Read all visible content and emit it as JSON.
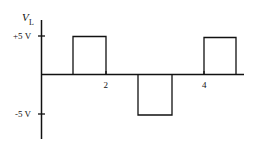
{
  "diagram": {
    "type": "waveform",
    "y_axis": {
      "label_main": "V",
      "label_sub": "L",
      "ticks": [
        {
          "label": "+5 V",
          "value": 5
        },
        {
          "label": "-5 V",
          "value": -5
        }
      ]
    },
    "x_axis": {
      "ticks": [
        {
          "label": "2",
          "value": 2
        },
        {
          "label": "4",
          "value": 4
        }
      ]
    },
    "pulses": [
      {
        "start": 1,
        "end": 2,
        "level": 5
      },
      {
        "start": 2.6,
        "end": 3.3,
        "level": -5
      },
      {
        "start": 4,
        "end": 4.6,
        "level": 5
      }
    ],
    "line_color": "#111111"
  }
}
